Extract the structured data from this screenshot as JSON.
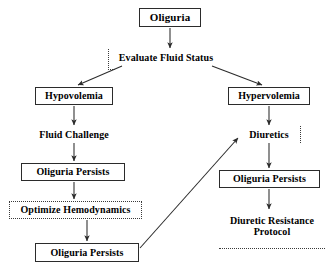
{
  "diagram": {
    "background_color": "#ffffff",
    "line_color": "#2b2b2b",
    "text_color": "#000000",
    "nodes": [
      {
        "id": "oliguria",
        "label": "Oliguria",
        "style": "solid",
        "x": 139,
        "y": 8,
        "w": 62,
        "h": 19,
        "font_size": 11
      },
      {
        "id": "evaluate-fluid-status",
        "label": "Evaluate Fluid Status",
        "style": "plain",
        "x": 110,
        "y": 50,
        "w": 112,
        "h": 15,
        "font_size": 10
      },
      {
        "id": "hypovolemia",
        "label": "Hypovolemia",
        "style": "solid",
        "x": 35,
        "y": 87,
        "w": 78,
        "h": 18,
        "font_size": 10
      },
      {
        "id": "hypervolemia",
        "label": "Hypervolemia",
        "style": "solid",
        "x": 228,
        "y": 87,
        "w": 82,
        "h": 18,
        "font_size": 10
      },
      {
        "id": "fluid-challenge",
        "label": "Fluid Challenge",
        "style": "plain",
        "x": 28,
        "y": 127,
        "w": 92,
        "h": 15,
        "font_size": 10
      },
      {
        "id": "diuretics",
        "label": "Diuretics",
        "style": "plain",
        "x": 240,
        "y": 127,
        "w": 58,
        "h": 15,
        "font_size": 10
      },
      {
        "id": "oliguria-persists-left-1",
        "label": "Oliguria Persists",
        "style": "solid",
        "x": 21,
        "y": 163,
        "w": 104,
        "h": 18,
        "font_size": 10
      },
      {
        "id": "oliguria-persists-right",
        "label": "Oliguria Persists",
        "style": "solid",
        "x": 219,
        "y": 170,
        "w": 101,
        "h": 18,
        "font_size": 10
      },
      {
        "id": "optimize-hemodynamics",
        "label": "Optimize Hemodynamics",
        "style": "dashed",
        "x": 9,
        "y": 201,
        "w": 133,
        "h": 18,
        "font_size": 10
      },
      {
        "id": "diuretic-resistance-protocol",
        "label": "Diuretic Resistance\nProtocol",
        "style": "plain",
        "x": 219,
        "y": 211,
        "w": 106,
        "h": 30,
        "font_size": 10
      },
      {
        "id": "oliguria-persists-left-2",
        "label": "Oliguria Persists",
        "style": "solid",
        "x": 35,
        "y": 243,
        "w": 104,
        "h": 19,
        "font_size": 10
      }
    ],
    "edges": [
      {
        "id": "edge-oliguria-to-evaluate",
        "from": "oliguria",
        "to": "evaluate-fluid-status",
        "kind": "arrow",
        "x1": 170,
        "y1": 28,
        "x2": 170,
        "y2": 48
      },
      {
        "id": "edge-evaluate-to-hypovolemia",
        "from": "evaluate-fluid-status",
        "to": "hypovolemia",
        "kind": "arrow",
        "x1": 122,
        "y1": 66,
        "x2": 78,
        "y2": 85
      },
      {
        "id": "edge-evaluate-to-hypervolemia",
        "from": "evaluate-fluid-status",
        "to": "hypervolemia",
        "kind": "arrow",
        "x1": 212,
        "y1": 66,
        "x2": 262,
        "y2": 85
      },
      {
        "id": "edge-hypovolemia-to-fluid-challenge",
        "from": "hypovolemia",
        "to": "fluid-challenge",
        "kind": "arrow",
        "x1": 74,
        "y1": 106,
        "x2": 74,
        "y2": 125
      },
      {
        "id": "edge-hypervolemia-to-diuretics",
        "from": "hypervolemia",
        "to": "diuretics",
        "kind": "arrow",
        "x1": 269,
        "y1": 106,
        "x2": 269,
        "y2": 125
      },
      {
        "id": "edge-fluid-challenge-to-persists1",
        "from": "fluid-challenge",
        "to": "oliguria-persists-left-1",
        "kind": "arrow",
        "x1": 74,
        "y1": 143,
        "x2": 74,
        "y2": 161
      },
      {
        "id": "edge-diuretics-to-persists-right",
        "from": "diuretics",
        "to": "oliguria-persists-right",
        "kind": "arrow",
        "x1": 269,
        "y1": 143,
        "x2": 269,
        "y2": 168
      },
      {
        "id": "edge-persists1-to-optimize",
        "from": "oliguria-persists-left-1",
        "to": "optimize-hemodynamics",
        "kind": "arrow",
        "x1": 74,
        "y1": 182,
        "x2": 74,
        "y2": 199
      },
      {
        "id": "edge-persists-right-to-protocol",
        "from": "oliguria-persists-right",
        "to": "diuretic-resistance-protocol",
        "kind": "arrow",
        "x1": 269,
        "y1": 189,
        "x2": 269,
        "y2": 209
      },
      {
        "id": "edge-optimize-to-persists2",
        "from": "optimize-hemodynamics",
        "to": "oliguria-persists-left-2",
        "kind": "arrow",
        "x1": 87,
        "y1": 220,
        "x2": 87,
        "y2": 241
      },
      {
        "id": "edge-persists2-to-diuretics",
        "from": "oliguria-persists-left-2",
        "to": "diuretics",
        "kind": "arrow",
        "x1": 140,
        "y1": 248,
        "x2": 238,
        "y2": 138
      }
    ],
    "decorations": [
      {
        "id": "dotted-rule-left-of-evaluate",
        "kind": "dotted-corner-left",
        "x": 108,
        "y": 49,
        "w": 6,
        "h": 20
      },
      {
        "id": "dotted-rule-right-of-diuretics",
        "kind": "dotted-vertical",
        "x": 300,
        "y": 126,
        "w": 1,
        "h": 17
      },
      {
        "id": "dotted-rule-below-protocol",
        "kind": "dotted-horizontal",
        "x": 219,
        "y": 248,
        "w": 106,
        "h": 1
      }
    ]
  }
}
